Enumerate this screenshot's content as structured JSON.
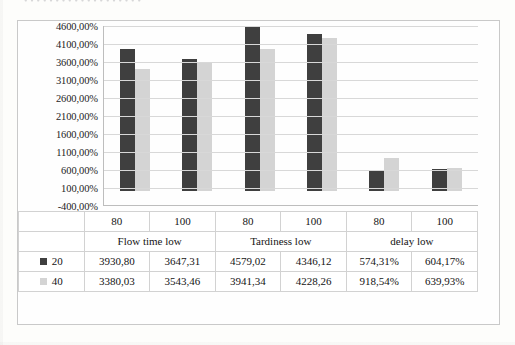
{
  "title_fragment": "• • • • • • • • • •  • • • • • • • • •",
  "colors": {
    "series_20": "#3f3f3f",
    "series_40": "#d4d4d4",
    "gridline": "#d8d8d8",
    "axis": "#bdbdbd",
    "page_background": "#fdfdfb"
  },
  "chart_data": {
    "type": "bar",
    "title": "",
    "xlabel": "",
    "ylabel": "",
    "ylim": [
      -400,
      4600
    ],
    "ytick_step": 500,
    "ytick_labels": [
      "4600,00%",
      "4100,00%",
      "3600,00%",
      "3100,00%",
      "2600,00%",
      "2100,00%",
      "1600,00%",
      "1100,00%",
      "600,00%",
      "100,00%",
      "-400,00%"
    ],
    "ytick_values": [
      4600,
      4100,
      3600,
      3100,
      2600,
      2100,
      1600,
      1100,
      600,
      100,
      -400
    ],
    "grid": true,
    "legend_position": "data-table-left",
    "groups": [
      "Flow time low",
      "Tardiness low",
      "delay low"
    ],
    "categories": [
      "80",
      "100",
      "80",
      "100",
      "80",
      "100"
    ],
    "series": [
      {
        "name": "20",
        "color": "#3f3f3f",
        "values": [
          3930.8,
          3647.31,
          4579.02,
          4346.12,
          574.31,
          604.17
        ],
        "labels": [
          "3930,80",
          "3647,31",
          "4579,02",
          "4346,12",
          "574,31%",
          "604,17%"
        ]
      },
      {
        "name": "40",
        "color": "#d4d4d4",
        "values": [
          3380.03,
          3543.46,
          3941.34,
          4228.26,
          918.54,
          639.93
        ],
        "labels": [
          "3380,03",
          "3543,46",
          "3941,34",
          "4228,26",
          "918,54%",
          "639,93%"
        ]
      }
    ]
  },
  "table": {
    "group_headers": [
      "Flow time low",
      "Tardiness low",
      "delay low"
    ],
    "category_row": [
      "80",
      "100",
      "80",
      "100",
      "80",
      "100"
    ],
    "rows": [
      {
        "legend": "20",
        "swatch": "series-20-swatch",
        "cells": [
          "3930,80",
          "3647,31",
          "4579,02",
          "4346,12",
          "574,31%",
          "604,17%"
        ]
      },
      {
        "legend": "40",
        "swatch": "series-40-swatch",
        "cells": [
          "3380,03",
          "3543,46",
          "3941,34",
          "4228,26",
          "918,54%",
          "639,93%"
        ]
      }
    ]
  }
}
